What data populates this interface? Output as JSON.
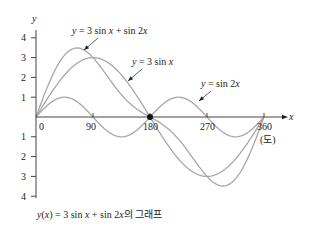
{
  "chart_data": {
    "type": "line",
    "title": "",
    "xlabel": "x",
    "ylabel": "y",
    "x_unit_label": "(도)",
    "xlim": [
      0,
      360
    ],
    "ylim": [
      -4,
      4
    ],
    "x_ticks": [
      0,
      90,
      180,
      270,
      360
    ],
    "x_tick_labels": [
      "0",
      "90",
      "180",
      "270",
      "360"
    ],
    "y_ticks_positive": [
      1,
      2,
      3,
      4
    ],
    "y_ticks_negative": [
      -1,
      -2,
      -3,
      -4
    ],
    "y_tick_labels_positive": [
      "1",
      "2",
      "3",
      "4"
    ],
    "y_tick_labels_negative": [
      "1",
      "2",
      "3",
      "4"
    ],
    "grid": false,
    "series": [
      {
        "name": "y = 3 sin x + sin 2x",
        "formula": "3*sin(x)+sin(2x)",
        "color": "#a8a8a8"
      },
      {
        "name": "y = 3 sin x",
        "formula": "3*sin(x)",
        "color": "#a8a8a8"
      },
      {
        "name": "y = sin 2x",
        "formula": "sin(2x)",
        "color": "#a8a8a8"
      }
    ],
    "annotations": [
      {
        "text_parts": [
          "y",
          " = 3 sin ",
          "x",
          " + sin 2",
          "x"
        ],
        "target_series": "y = 3 sin x + sin 2x"
      },
      {
        "text_parts": [
          "y",
          " = 3 sin ",
          "x"
        ],
        "target_series": "y = 3 sin x"
      },
      {
        "text_parts": [
          "y",
          " = sin 2",
          "x"
        ],
        "target_series": "y = sin 2x"
      }
    ],
    "marked_point": {
      "x": 180,
      "y": 0
    },
    "caption": {
      "y": "y",
      "paren_open": "(",
      "x1": "x",
      "mid": ") = 3 sin ",
      "x2": "x",
      "mid2": " + sin 2",
      "x3": "x",
      "suffix": "의 그래프"
    }
  }
}
